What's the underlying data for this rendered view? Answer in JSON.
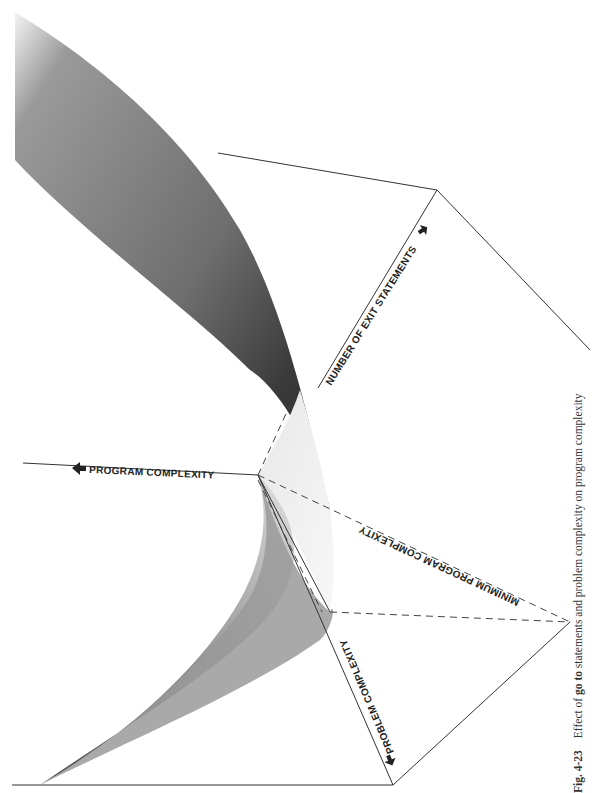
{
  "figure": {
    "number": "Fig. 4-23",
    "caption_prefix": "Effect of ",
    "caption_keyword": "go to",
    "caption_suffix": " statements and problem complexity on program complexity",
    "orientation": "rotated 90° counter-clockwise on page"
  },
  "axes": {
    "program_complexity": {
      "label": "PROGRAM COMPLEXITY",
      "arrow": "left"
    },
    "exit_statements": {
      "label": "NUMBER OF EXIT STATEMENTS",
      "arrow": "up-right"
    },
    "problem_complexity": {
      "label": "PROBLEM COMPLEXITY",
      "arrow": "down-right"
    },
    "minimum": {
      "label": "MINIMUM PROGRAM COMPLEXITY",
      "style": "dashed"
    }
  },
  "colors": {
    "surface_dark": "#3a3a3a",
    "surface_mid": "#8a8a8a",
    "surface_light": "#dcdcdc",
    "line": "#333333",
    "background": "#ffffff"
  }
}
